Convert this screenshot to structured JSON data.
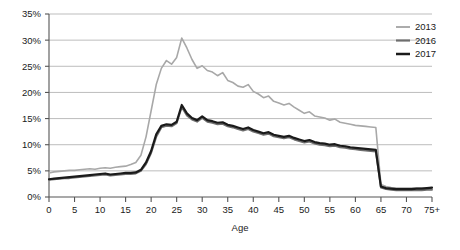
{
  "chart_data": {
    "type": "line",
    "title": "",
    "xlabel": "Age",
    "ylabel": "",
    "xlim": [
      0,
      75
    ],
    "ylim": [
      0,
      35
    ],
    "grid": true,
    "legend_position": "top-right",
    "x_tick_labels": [
      "0",
      "5",
      "10",
      "15",
      "20",
      "25",
      "30",
      "35",
      "40",
      "45",
      "50",
      "55",
      "60",
      "65",
      "70",
      "75+"
    ],
    "x_ticks": [
      0,
      5,
      10,
      15,
      20,
      25,
      30,
      35,
      40,
      45,
      50,
      55,
      60,
      65,
      70,
      75
    ],
    "y_tick_labels": [
      "0%",
      "5%",
      "10%",
      "15%",
      "20%",
      "25%",
      "30%",
      "35%"
    ],
    "y_ticks": [
      0,
      5,
      10,
      15,
      20,
      25,
      30,
      35
    ],
    "x": [
      0,
      1,
      2,
      3,
      4,
      5,
      6,
      7,
      8,
      9,
      10,
      11,
      12,
      13,
      14,
      15,
      16,
      17,
      18,
      19,
      20,
      21,
      22,
      23,
      24,
      25,
      26,
      27,
      28,
      29,
      30,
      31,
      32,
      33,
      34,
      35,
      36,
      37,
      38,
      39,
      40,
      41,
      42,
      43,
      44,
      45,
      46,
      47,
      48,
      49,
      50,
      51,
      52,
      53,
      54,
      55,
      56,
      57,
      58,
      59,
      60,
      61,
      62,
      63,
      64,
      65,
      66,
      67,
      68,
      69,
      70,
      71,
      72,
      73,
      74,
      75
    ],
    "series": [
      {
        "name": "2013",
        "color": "#a8a8a8",
        "width": 1.6,
        "values": [
          4.6,
          4.8,
          4.9,
          5.0,
          5.1,
          5.1,
          5.2,
          5.3,
          5.4,
          5.3,
          5.5,
          5.6,
          5.5,
          5.7,
          5.8,
          5.9,
          6.2,
          6.6,
          8.0,
          11.5,
          16.5,
          21.5,
          24.6,
          26.1,
          25.4,
          26.7,
          30.4,
          28.5,
          26.3,
          24.6,
          25.1,
          24.2,
          23.9,
          23.2,
          23.8,
          22.3,
          21.9,
          21.2,
          21.0,
          21.5,
          20.2,
          19.7,
          19.0,
          19.3,
          18.3,
          18.0,
          17.6,
          17.9,
          17.2,
          16.6,
          16.0,
          16.3,
          15.5,
          15.3,
          15.1,
          14.7,
          14.9,
          14.3,
          14.1,
          13.9,
          13.7,
          13.6,
          13.5,
          13.4,
          13.3,
          2.4,
          2.0,
          1.8,
          1.7,
          1.7,
          1.7,
          1.7,
          1.7,
          1.7,
          1.7,
          1.7
        ]
      },
      {
        "name": "2016",
        "color": "#6e6e6e",
        "width": 1.9,
        "values": [
          3.3,
          3.4,
          3.5,
          3.6,
          3.6,
          3.7,
          3.8,
          3.9,
          4.0,
          4.1,
          4.2,
          4.3,
          4.1,
          4.2,
          4.3,
          4.4,
          4.4,
          4.5,
          5.0,
          6.3,
          8.4,
          11.5,
          13.3,
          13.6,
          13.5,
          14.1,
          17.2,
          15.6,
          14.8,
          14.4,
          15.1,
          14.4,
          14.2,
          13.9,
          14.0,
          13.5,
          13.3,
          13.0,
          12.7,
          13.0,
          12.5,
          12.2,
          11.9,
          12.1,
          11.6,
          11.4,
          11.2,
          11.4,
          11.0,
          10.7,
          10.4,
          10.6,
          10.2,
          10.0,
          9.9,
          9.7,
          9.8,
          9.5,
          9.4,
          9.2,
          9.1,
          9.0,
          8.9,
          8.8,
          8.7,
          1.8,
          1.5,
          1.4,
          1.3,
          1.3,
          1.3,
          1.3,
          1.3,
          1.3,
          1.4,
          1.4
        ]
      },
      {
        "name": "2017",
        "color": "#1a1a1a",
        "width": 2.2,
        "values": [
          3.4,
          3.5,
          3.6,
          3.7,
          3.8,
          3.9,
          4.0,
          4.1,
          4.2,
          4.3,
          4.4,
          4.5,
          4.3,
          4.4,
          4.5,
          4.6,
          4.6,
          4.7,
          5.2,
          6.6,
          8.8,
          12.0,
          13.6,
          13.9,
          13.8,
          14.4,
          17.6,
          16.0,
          15.1,
          14.7,
          15.4,
          14.7,
          14.5,
          14.2,
          14.3,
          13.8,
          13.6,
          13.3,
          13.0,
          13.3,
          12.8,
          12.5,
          12.2,
          12.4,
          11.9,
          11.7,
          11.5,
          11.7,
          11.3,
          11.0,
          10.7,
          10.9,
          10.5,
          10.3,
          10.2,
          10.0,
          10.1,
          9.8,
          9.7,
          9.5,
          9.4,
          9.3,
          9.2,
          9.1,
          9.0,
          2.0,
          1.7,
          1.6,
          1.5,
          1.5,
          1.5,
          1.5,
          1.6,
          1.6,
          1.7,
          1.8
        ]
      }
    ]
  },
  "legend": {
    "items": [
      {
        "label": "2013"
      },
      {
        "label": "2016"
      },
      {
        "label": "2017"
      }
    ]
  },
  "colors": {
    "grid": "#b5b5b5",
    "axis": "#555555",
    "text": "#1a1a1a",
    "background": "#ffffff"
  }
}
